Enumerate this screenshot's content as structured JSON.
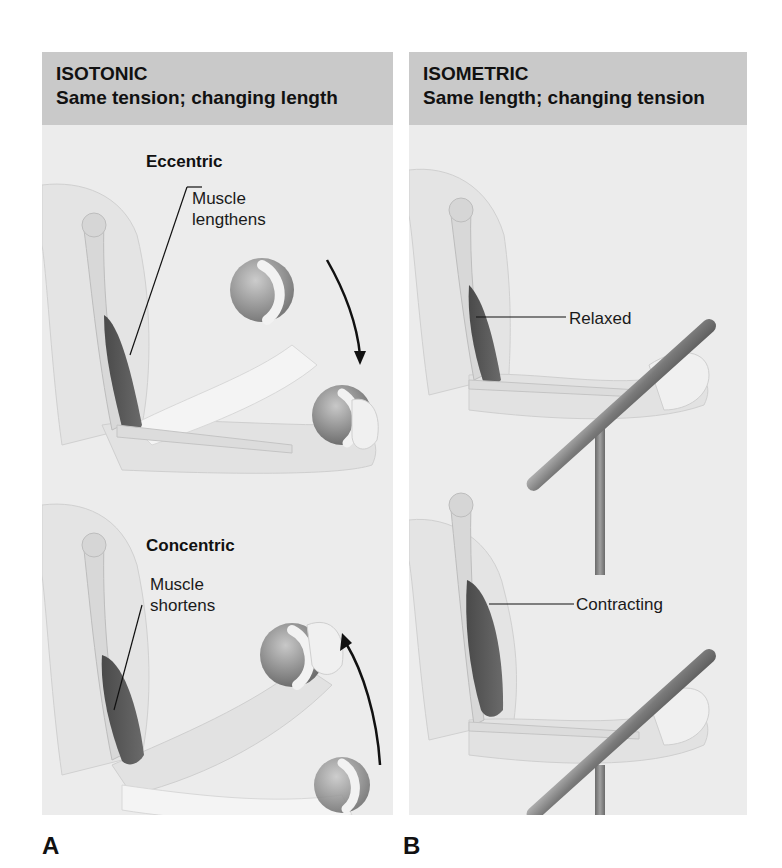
{
  "figure": {
    "panels": [
      {
        "letter": "A",
        "title": "ISOTONIC",
        "subtitle": "Same tension; changing length",
        "scenes": [
          {
            "heading": "Eccentric",
            "callout": "Muscle lengthens",
            "callout_lines": [
              "Muscle",
              "lengthens"
            ],
            "motion": "downward arrow"
          },
          {
            "heading": "Concentric",
            "callout": "Muscle shortens",
            "callout_lines": [
              "Muscle",
              "shortens"
            ],
            "motion": "upward arrow"
          }
        ]
      },
      {
        "letter": "B",
        "title": "ISOMETRIC",
        "subtitle": "Same length; changing tension",
        "scenes": [
          {
            "callout": "Relaxed"
          },
          {
            "callout": "Contracting"
          }
        ]
      }
    ],
    "colors": {
      "header_band": "#c9c9c9",
      "panel_bg": "#ececec",
      "muscle": "#5a5a5a",
      "skin": "#e2e2e2",
      "bone": "#d8d8d8",
      "bar": "#8a8a8a",
      "ball": "#9a9a9a"
    }
  }
}
